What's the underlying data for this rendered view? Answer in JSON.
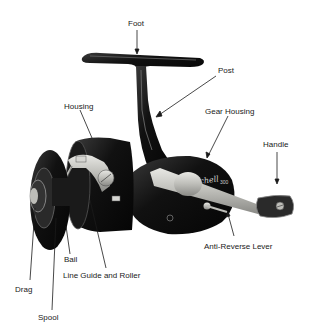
{
  "diagram": {
    "brand_marking": "Mitchell",
    "model_marking": "300",
    "labels": [
      {
        "id": "foot",
        "text": "Foot"
      },
      {
        "id": "post",
        "text": "Post"
      },
      {
        "id": "housing",
        "text": "Housing"
      },
      {
        "id": "gear-housing",
        "text": "Gear Housing"
      },
      {
        "id": "handle",
        "text": "Handle"
      },
      {
        "id": "anti-reverse-lever",
        "text": "Anti-Reverse Lever"
      },
      {
        "id": "bail",
        "text": "Bail"
      },
      {
        "id": "line-guide-and-roller",
        "text": "Line Guide and Roller"
      },
      {
        "id": "drag",
        "text": "Drag"
      },
      {
        "id": "spool",
        "text": "Spool"
      }
    ],
    "caption": "",
    "colors": {
      "background": "#ffffff",
      "reel_body": "#141414",
      "metal_highlight": "#c9c9c4",
      "label_text": "#1a1a1a",
      "leader_line": "#1a1a1a"
    }
  }
}
